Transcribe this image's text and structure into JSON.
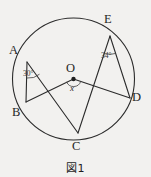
{
  "figure": {
    "caption": "図1",
    "center_label": "O",
    "unknown_angle_label": "x",
    "vertices": [
      {
        "id": "A",
        "label": "A",
        "x": 22,
        "y": 57
      },
      {
        "id": "B",
        "label": "B",
        "x": 25,
        "y": 107
      },
      {
        "id": "C",
        "label": "C",
        "x": 78,
        "y": 137
      },
      {
        "id": "D",
        "label": "D",
        "x": 131,
        "y": 94
      },
      {
        "id": "E",
        "label": "E",
        "x": 110,
        "y": 31
      }
    ],
    "angles": [
      {
        "id": "angle-a",
        "label": "30°",
        "at": "A"
      },
      {
        "id": "angle-e",
        "label": "34°",
        "at": "E"
      },
      {
        "id": "angle-o",
        "label": "x",
        "at": "O"
      }
    ],
    "labels": {
      "A": "A",
      "B": "B",
      "C": "C",
      "D": "D",
      "E": "E",
      "O": "O"
    },
    "colors": {
      "background": "#f2f1ef",
      "stroke": "#2b2b2b",
      "text": "#262626"
    }
  }
}
